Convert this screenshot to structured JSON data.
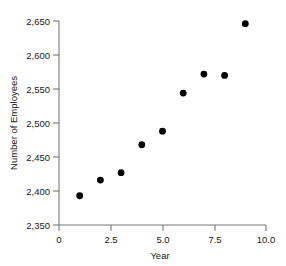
{
  "chart_data": {
    "type": "scatter",
    "title": "",
    "xlabel": "Year",
    "ylabel": "Number of Employees",
    "x": [
      1,
      2,
      3,
      4,
      5,
      6,
      7,
      8,
      9
    ],
    "values": [
      2393,
      2416,
      2427,
      2468,
      2488,
      2544,
      2572,
      2570,
      2646
    ],
    "series": [
      {
        "name": "Number of Employees",
        "points": [
          {
            "x": 1,
            "y": 2393
          },
          {
            "x": 2,
            "y": 2416
          },
          {
            "x": 3,
            "y": 2427
          },
          {
            "x": 4,
            "y": 2468
          },
          {
            "x": 5,
            "y": 2488
          },
          {
            "x": 6,
            "y": 2544
          },
          {
            "x": 7,
            "y": 2572
          },
          {
            "x": 8,
            "y": 2570
          },
          {
            "x": 9,
            "y": 2646
          }
        ]
      }
    ],
    "xlim": [
      0,
      10
    ],
    "ylim": [
      2350,
      2650
    ],
    "xticks": [
      0,
      2.5,
      5.0,
      7.5,
      10.0
    ],
    "xtick_labels": [
      "0",
      "2.5",
      "5.0",
      "7.5",
      "10.0"
    ],
    "yticks": [
      2350,
      2400,
      2450,
      2500,
      2550,
      2600,
      2650
    ],
    "ytick_labels": [
      "2,350",
      "2,400",
      "2,450",
      "2,500",
      "2,550",
      "2,600",
      "2,650"
    ],
    "grid": false,
    "legend": "none",
    "marker": "filled-circle",
    "marker_color": "#000000",
    "axis_color": "#777777"
  }
}
